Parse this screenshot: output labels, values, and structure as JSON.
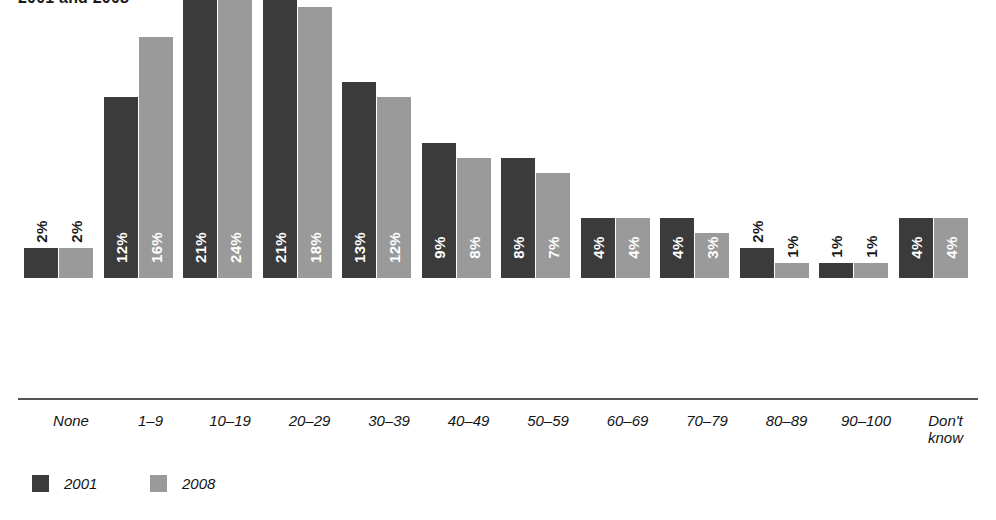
{
  "chart_data": {
    "type": "bar",
    "title": "2001 and 2008",
    "xlabel": "",
    "ylabel": "",
    "ylim": [
      0,
      25
    ],
    "grid": false,
    "legend_position": "bottom-left",
    "value_suffix": "%",
    "categories": [
      "None",
      "1–9",
      "10–19",
      "20–29",
      "30–39",
      "40–49",
      "50–59",
      "60–69",
      "70–79",
      "80–89",
      "90–100",
      "Don't know"
    ],
    "series": [
      {
        "name": "2001",
        "color": "#3b3b3b",
        "values": [
          2,
          12,
          21,
          21,
          13,
          9,
          8,
          4,
          4,
          2,
          1,
          4
        ],
        "labels": [
          "2%",
          "12%",
          "21%",
          "21%",
          "13%",
          "9%",
          "8%",
          "4%",
          "4%",
          "2%",
          "1%",
          "4%"
        ],
        "label_placement": [
          "outside",
          "inside",
          "inside",
          "inside",
          "inside",
          "inside",
          "inside",
          "inside",
          "inside",
          "outside",
          "outside",
          "inside"
        ]
      },
      {
        "name": "2008",
        "color": "#9a9a9a",
        "values": [
          2,
          16,
          24,
          18,
          12,
          8,
          7,
          4,
          3,
          1,
          1,
          4
        ],
        "labels": [
          "2%",
          "16%",
          "24%",
          "18%",
          "12%",
          "8%",
          "7%",
          "4%",
          "3%",
          "1%",
          "1%",
          "4%"
        ],
        "label_placement": [
          "outside",
          "inside",
          "inside",
          "inside",
          "inside",
          "inside",
          "inside",
          "inside",
          "inside",
          "outside",
          "outside",
          "inside"
        ]
      }
    ]
  },
  "legend": {
    "items": [
      {
        "label": "2001",
        "color": "#3b3b3b"
      },
      {
        "label": "2008",
        "color": "#9a9a9a"
      }
    ]
  },
  "axis": {
    "baseline_color": "#555555"
  }
}
